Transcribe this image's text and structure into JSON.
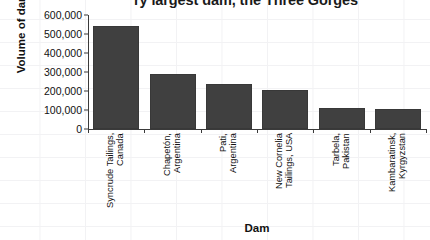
{
  "chart_data": {
    "type": "bar",
    "title": "ry largest dam, the Three Gorges",
    "xlabel": "Dam",
    "ylabel": "Volume of dam (m³)",
    "categories": [
      "Syncrude Tailings,\nCanada",
      "Chapetón,\nArgentina",
      "Pati,\nArgentina",
      "New Cornelia\nTailings, USA",
      "Tarbela,\nPakistan",
      "Kambaratinsk,\nKyrgyzstan"
    ],
    "values": [
      540000,
      290000,
      235000,
      205000,
      110000,
      105000
    ],
    "ylim": [
      0,
      600000
    ],
    "ytick_values": [
      0,
      100000,
      200000,
      300000,
      400000,
      500000,
      600000
    ],
    "ytick_labels": [
      "0",
      "100,000",
      "200,000",
      "300,000",
      "400,000",
      "500,000",
      "600,000"
    ],
    "grid": true,
    "legend": null,
    "bar_color": "#404040",
    "axis_color": "#3a3a3a",
    "background_color": "#ffffff",
    "gridline_color": "#f2f2f4"
  }
}
